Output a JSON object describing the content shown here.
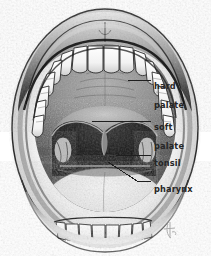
{
  "figure": {
    "background_color": "#ffffff",
    "ink_color": "#1a1a1a",
    "label_color": "#262626"
  },
  "labels": [
    {
      "id": "hard-palate",
      "text": "hard\npalate",
      "line1": "hard",
      "line2": "palate",
      "leader": {
        "type": "straight",
        "x1": 128,
        "y1": 80,
        "x2": 151,
        "y2": 80
      }
    },
    {
      "id": "soft-palate",
      "text": "soft\npalate",
      "line1": "soft",
      "line2": "palate",
      "leader": {
        "type": "straight",
        "x1": 92,
        "y1": 121,
        "x2": 151,
        "y2": 121
      }
    },
    {
      "id": "tonsil",
      "text": "tonsil",
      "line1": "tonsil",
      "leader": {
        "type": "straight",
        "x1": 116,
        "y1": 155,
        "x2": 151,
        "y2": 155
      }
    },
    {
      "id": "pharynx",
      "text": "pharynx",
      "line1": "pharynx",
      "leader": {
        "type": "diagonal",
        "x1": 108,
        "y1": 162,
        "bend_x": 137,
        "bend_y": 181,
        "x2": 151,
        "y2": 181
      }
    }
  ],
  "anatomy_parts": [
    {
      "name": "upper-lip"
    },
    {
      "name": "lower-lip"
    },
    {
      "name": "upper-teeth"
    },
    {
      "name": "lower-teeth"
    },
    {
      "name": "hard-palate"
    },
    {
      "name": "soft-palate"
    },
    {
      "name": "uvula"
    },
    {
      "name": "tonsil-left"
    },
    {
      "name": "tonsil-right"
    },
    {
      "name": "pharynx"
    },
    {
      "name": "tongue"
    }
  ],
  "signature": {
    "present": true,
    "description": "artist monogram"
  }
}
